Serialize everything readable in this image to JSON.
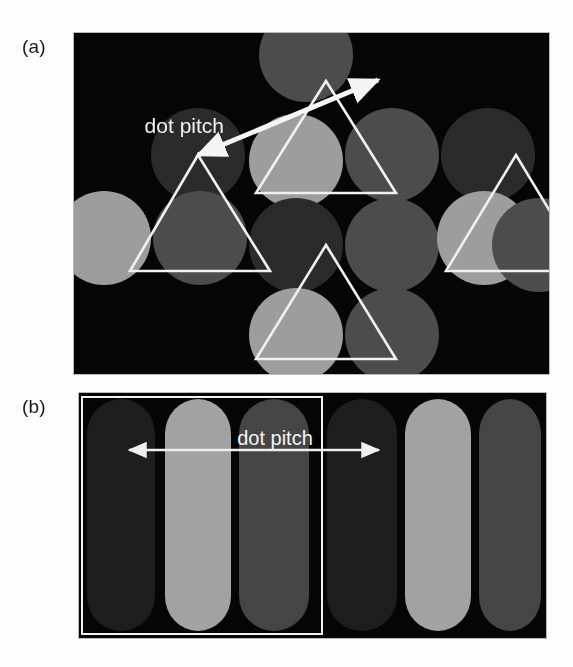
{
  "figure": {
    "kind": "scientific-figure",
    "background_color": "#fdfdfd"
  },
  "panels": [
    {
      "id": "a",
      "label": "(a)",
      "arrangement": "delta-triad-dot",
      "frame": {
        "x": 73,
        "y": 32,
        "width": 475,
        "height": 341,
        "background_color": "#050505",
        "border_color": "#b9b9b9"
      },
      "annotation": {
        "text": "dot pitch",
        "text_x": 150,
        "text_y": 100,
        "arrow": {
          "from_x": 304,
          "from_y": 47,
          "to_x": 124,
          "to_y": 122,
          "double_headed": true,
          "color": "#f5f5f5",
          "width": 5
        }
      },
      "phosphor_colors": {
        "light": "#9d9d9d",
        "medium": "#4c4c4c",
        "dark": "#2a2a2a"
      },
      "dot_radius": 47,
      "dots": [
        {
          "cx": 232,
          "cy": 22,
          "tone": "medium"
        },
        {
          "cx": 124,
          "cy": 122,
          "tone": "dark"
        },
        {
          "cx": 222,
          "cy": 128,
          "tone": "light"
        },
        {
          "cx": 318,
          "cy": 122,
          "tone": "medium"
        },
        {
          "cx": 414,
          "cy": 122,
          "tone": "dark"
        },
        {
          "cx": 30,
          "cy": 205,
          "tone": "light"
        },
        {
          "cx": 126,
          "cy": 205,
          "tone": "medium"
        },
        {
          "cx": 222,
          "cy": 212,
          "tone": "dark"
        },
        {
          "cx": 318,
          "cy": 212,
          "tone": "medium"
        },
        {
          "cx": 410,
          "cy": 205,
          "tone": "light"
        },
        {
          "cx": 465,
          "cy": 212,
          "tone": "medium"
        },
        {
          "cx": 222,
          "cy": 302,
          "tone": "light"
        },
        {
          "cx": 318,
          "cy": 302,
          "tone": "medium"
        }
      ],
      "triangles": [
        {
          "name": "triad-triangle-top",
          "p1x": 252,
          "p1y": 48,
          "p2x": 182,
          "p2y": 160,
          "p3x": 322,
          "p3y": 160
        },
        {
          "name": "triad-triangle-left",
          "p1x": 124,
          "p1y": 122,
          "p2x": 56,
          "p2y": 238,
          "p3x": 196,
          "p3y": 238
        },
        {
          "name": "triad-triangle-bottom",
          "p1x": 252,
          "p1y": 212,
          "p2x": 182,
          "p2y": 326,
          "p3x": 322,
          "p3y": 326
        },
        {
          "name": "triad-triangle-right",
          "p1x": 442,
          "p1y": 122,
          "p2x": 372,
          "p2y": 238,
          "p3x": 512,
          "p3y": 238
        }
      ],
      "triangle_stroke": "#f0f0f0",
      "triangle_stroke_width": 2.6
    },
    {
      "id": "b",
      "label": "(b)",
      "arrangement": "in-line-stripe",
      "frame": {
        "x": 78,
        "y": 392,
        "width": 467,
        "height": 245,
        "background_color": "#050505",
        "border_color": "#b9b9b9"
      },
      "annotation": {
        "text": "dot pitch",
        "text_x": 196,
        "text_y": 52,
        "arrow": {
          "from_x": 50,
          "from_y": 57,
          "to_x": 300,
          "to_y": 57,
          "double_headed": true,
          "color": "#f0f0f0",
          "width": 2.4
        }
      },
      "highlight_rect": {
        "x": 3,
        "y": 4,
        "width": 240,
        "height": 237,
        "stroke": "#f2f2f2",
        "stroke_width": 2
      },
      "phosphor_colors": {
        "light": "#a2a2a2",
        "medium": "#454545",
        "dark": "#1d1d1d"
      },
      "stripe_radius": 35,
      "stripes": [
        {
          "x": 8,
          "width": 68,
          "tone": "dark"
        },
        {
          "x": 86,
          "width": 66,
          "tone": "light"
        },
        {
          "x": 160,
          "width": 70,
          "tone": "medium"
        },
        {
          "x": 248,
          "width": 70,
          "tone": "dark"
        },
        {
          "x": 326,
          "width": 66,
          "tone": "light"
        },
        {
          "x": 400,
          "width": 62,
          "tone": "medium"
        }
      ],
      "stripe_top": 6,
      "stripe_height": 232
    }
  ],
  "legend_notes": {
    "tone_meaning_light": "light-gray phosphor dot",
    "tone_meaning_medium": "mid-gray phosphor dot",
    "tone_meaning_dark": "dark-gray phosphor dot"
  }
}
